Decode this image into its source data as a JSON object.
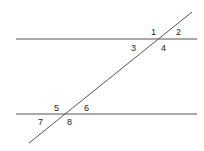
{
  "diagram": {
    "type": "parallel-lines-transversal",
    "colors": {
      "line": "#555555",
      "label": "#222222",
      "background": "#ffffff"
    },
    "lines": {
      "top": {
        "x1": 16,
        "y1": 39,
        "x2": 197,
        "y2": 39
      },
      "bottom": {
        "x1": 16,
        "y1": 114,
        "x2": 197,
        "y2": 114
      },
      "transversal": {
        "x1": 192,
        "y1": 12,
        "x2": 29,
        "y2": 143
      }
    },
    "angles": [
      {
        "label": "1",
        "x": 151,
        "y": 35
      },
      {
        "label": "2",
        "x": 176,
        "y": 35
      },
      {
        "label": "3",
        "x": 131,
        "y": 51
      },
      {
        "label": "4",
        "x": 161,
        "y": 51
      },
      {
        "label": "5",
        "x": 54,
        "y": 111
      },
      {
        "label": "6",
        "x": 84,
        "y": 111
      },
      {
        "label": "7",
        "x": 38,
        "y": 125
      },
      {
        "label": "8",
        "x": 67,
        "y": 125
      }
    ]
  }
}
